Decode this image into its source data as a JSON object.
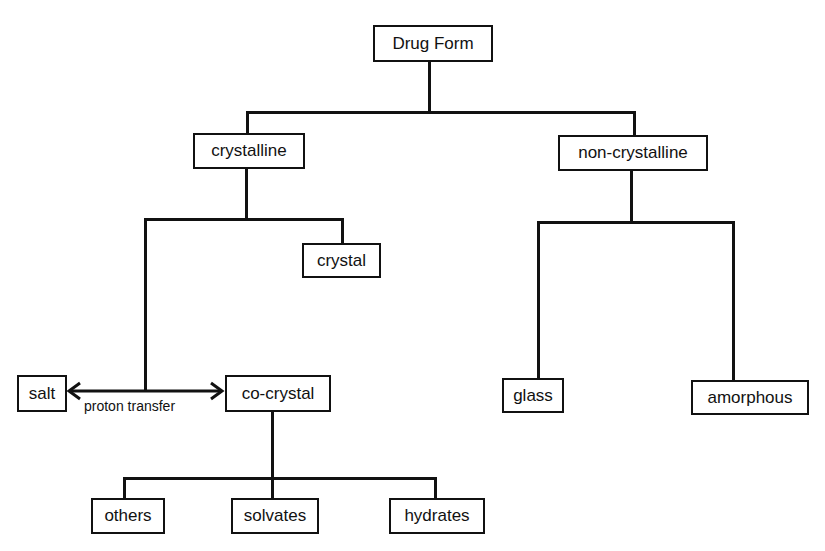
{
  "diagram": {
    "root": {
      "label": "Drug Form"
    },
    "level1": {
      "crystalline": {
        "label": "crystalline"
      },
      "non_crystalline": {
        "label": "non-crystalline"
      }
    },
    "crystalline_children": {
      "crystal": {
        "label": "crystal"
      },
      "salt": {
        "label": "salt"
      },
      "co_crystal": {
        "label": "co-crystal"
      },
      "relation_label": "proton transfer"
    },
    "co_crystal_children": [
      {
        "label": "others"
      },
      {
        "label": "solvates"
      },
      {
        "label": "hydrates"
      }
    ],
    "non_crystalline_children": [
      {
        "label": "glass"
      },
      {
        "label": "amorphous"
      }
    ],
    "colors": {
      "line": "#111111",
      "background": "#ffffff"
    }
  }
}
